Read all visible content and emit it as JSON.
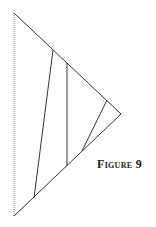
{
  "figure": {
    "caption": "Figure 9",
    "stroke_color": "#333333",
    "dashed_color": "#888888"
  },
  "geometry": {
    "triangle": {
      "top": [
        14,
        13
      ],
      "right": [
        121,
        114
      ],
      "bottom": [
        14,
        216
      ]
    },
    "left_edge_style": "dotted",
    "inner_lines": [
      {
        "from": [
          53,
          50
        ],
        "to": [
          34,
          198
        ]
      },
      {
        "from": [
          67,
          63
        ],
        "to": [
          67,
          166
        ]
      },
      {
        "from": [
          107,
          100
        ],
        "to": [
          82,
          151
        ]
      }
    ]
  }
}
